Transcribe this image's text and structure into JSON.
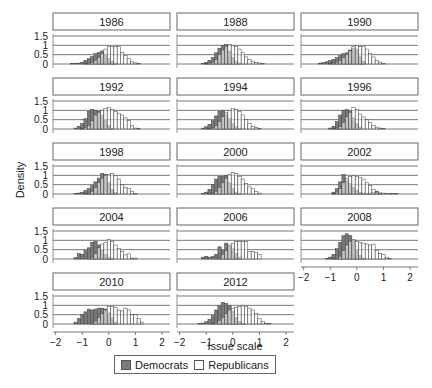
{
  "chart_data": {
    "type": "bar",
    "subtype": "faceted overlapping histograms",
    "title": "",
    "xlabel": "Issue scale",
    "ylabel": "Density",
    "xlim": [
      -2.1,
      2.3
    ],
    "ylim": [
      0,
      1.5
    ],
    "xticks": [
      -2,
      -1,
      0,
      1,
      2
    ],
    "yticks": [
      0,
      0.5,
      1,
      1.5
    ],
    "ytick_labels": [
      "0",
      "0.5",
      "1",
      "1.5"
    ],
    "grid": "horizontal",
    "legend": {
      "position": "bottom",
      "entries": [
        {
          "label": "Democrats",
          "color": "#777777"
        },
        {
          "label": "Republicans",
          "color": "#ffffff"
        }
      ]
    },
    "bin_centers": [
      -1.75,
      -1.625,
      -1.5,
      -1.375,
      -1.25,
      -1.125,
      -1.0,
      -0.875,
      -0.75,
      -0.625,
      -0.5,
      -0.375,
      -0.25,
      -0.125,
      0.0,
      0.125,
      0.25,
      0.375,
      0.5,
      0.625,
      0.75,
      0.875,
      1.0,
      1.125,
      1.25,
      1.375,
      1.5,
      1.625,
      1.75
    ],
    "panels": [
      {
        "year": "1986",
        "democrats": [
          0,
          0,
          0,
          0.02,
          0.03,
          0.05,
          0.1,
          0.2,
          0.3,
          0.4,
          0.55,
          0.62,
          0.7,
          0.5,
          0.3,
          0.15,
          0.05,
          0,
          0,
          0,
          0,
          0,
          0,
          0,
          0,
          0,
          0,
          0,
          0
        ],
        "republicans": [
          0,
          0,
          0,
          0,
          0,
          0,
          0,
          0.02,
          0.05,
          0.1,
          0.2,
          0.35,
          0.55,
          0.8,
          0.95,
          0.92,
          0.95,
          0.95,
          0.62,
          0.45,
          0.28,
          0.12,
          0.06,
          0.02,
          0,
          0,
          0,
          0,
          0
        ]
      },
      {
        "year": "1988",
        "democrats": [
          0,
          0,
          0,
          0,
          0,
          0.03,
          0.08,
          0.2,
          0.35,
          0.6,
          0.85,
          1.0,
          1.05,
          0.7,
          0.35,
          0.15,
          0.05,
          0,
          0,
          0,
          0,
          0,
          0,
          0,
          0,
          0,
          0,
          0,
          0
        ],
        "republicans": [
          0,
          0,
          0,
          0,
          0,
          0,
          0.02,
          0.05,
          0.1,
          0.25,
          0.5,
          0.75,
          0.95,
          1.05,
          1.0,
          0.95,
          0.8,
          0.6,
          0.38,
          0.25,
          0.15,
          0.08,
          0.05,
          0.02,
          0,
          0,
          0,
          0,
          0
        ]
      },
      {
        "year": "1990",
        "democrats": [
          0,
          0,
          0,
          0.05,
          0.08,
          0.12,
          0.18,
          0.25,
          0.35,
          0.45,
          0.55,
          0.6,
          0.75,
          0.85,
          0.8,
          0.4,
          0.15,
          0,
          0,
          0,
          0,
          0,
          0,
          0,
          0,
          0,
          0,
          0,
          0
        ],
        "republicans": [
          0,
          0,
          0,
          0,
          0,
          0,
          0.02,
          0.05,
          0.1,
          0.2,
          0.35,
          0.5,
          0.7,
          0.95,
          1.0,
          0.95,
          0.95,
          0.8,
          0.55,
          0.38,
          0.2,
          0.1,
          0.03,
          0,
          0,
          0,
          0,
          0,
          0
        ]
      },
      {
        "year": "1992",
        "democrats": [
          0,
          0,
          0,
          0,
          0.05,
          0.15,
          0.3,
          0.55,
          0.95,
          1.05,
          1.0,
          0.95,
          0.75,
          0.45,
          0.2,
          0.05,
          0,
          0,
          0,
          0,
          0,
          0,
          0,
          0,
          0,
          0,
          0,
          0,
          0
        ],
        "republicans": [
          0,
          0,
          0,
          0,
          0,
          0,
          0.03,
          0.08,
          0.2,
          0.45,
          0.75,
          0.9,
          1.0,
          1.1,
          1.15,
          1.05,
          0.95,
          0.85,
          0.75,
          0.6,
          0.45,
          0.2,
          0.05,
          0.02,
          0,
          0,
          0,
          0,
          0
        ]
      },
      {
        "year": "1994",
        "democrats": [
          0,
          0,
          0,
          0,
          0,
          0.05,
          0.12,
          0.25,
          0.45,
          0.7,
          0.95,
          1.0,
          0.8,
          0.55,
          0.3,
          0.12,
          0.05,
          0,
          0,
          0,
          0,
          0,
          0,
          0,
          0,
          0,
          0,
          0,
          0
        ],
        "republicans": [
          0,
          0,
          0,
          0,
          0,
          0,
          0,
          0.03,
          0.08,
          0.2,
          0.4,
          0.65,
          0.9,
          1.0,
          1.1,
          1.05,
          0.95,
          0.75,
          0.5,
          0.3,
          0.15,
          0.07,
          0.02,
          0,
          0,
          0,
          0,
          0,
          0
        ]
      },
      {
        "year": "1996",
        "democrats": [
          0,
          0,
          0,
          0,
          0,
          0,
          0.05,
          0.15,
          0.4,
          0.75,
          1.0,
          1.05,
          0.95,
          0.6,
          0.3,
          0.1,
          0,
          0,
          0,
          0,
          0,
          0,
          0,
          0,
          0,
          0,
          0,
          0,
          0
        ],
        "republicans": [
          0,
          0,
          0,
          0,
          0,
          0,
          0,
          0.02,
          0.05,
          0.15,
          0.35,
          0.65,
          0.9,
          1.15,
          1.05,
          0.8,
          0.65,
          0.5,
          0.35,
          0.2,
          0.1,
          0.05,
          0.02,
          0,
          0,
          0,
          0,
          0,
          0
        ]
      },
      {
        "year": "1998",
        "democrats": [
          0,
          0,
          0,
          0,
          0.03,
          0.05,
          0.1,
          0.2,
          0.3,
          0.45,
          0.65,
          0.85,
          1.1,
          1.05,
          0.6,
          0.25,
          0.08,
          0,
          0,
          0,
          0,
          0,
          0,
          0,
          0,
          0,
          0,
          0,
          0
        ],
        "republicans": [
          0,
          0,
          0,
          0,
          0,
          0,
          0,
          0.02,
          0.05,
          0.15,
          0.35,
          0.6,
          0.85,
          1.0,
          1.05,
          1.1,
          1.0,
          0.8,
          0.5,
          0.35,
          0.3,
          0.15,
          0.03,
          0,
          0,
          0,
          0,
          0,
          0
        ]
      },
      {
        "year": "2000",
        "democrats": [
          0,
          0,
          0,
          0,
          0,
          0.03,
          0.1,
          0.25,
          0.5,
          0.8,
          0.95,
          0.95,
          1.0,
          0.6,
          0.3,
          0.1,
          0.03,
          0,
          0,
          0,
          0,
          0,
          0,
          0,
          0,
          0,
          0,
          0,
          0
        ],
        "republicans": [
          0,
          0,
          0,
          0,
          0,
          0,
          0,
          0.02,
          0.05,
          0.15,
          0.35,
          0.6,
          0.85,
          1.05,
          1.15,
          1.1,
          0.95,
          0.8,
          0.55,
          0.38,
          0.28,
          0.15,
          0.05,
          0,
          0,
          0,
          0,
          0,
          0
        ]
      },
      {
        "year": "2002",
        "democrats": [
          0,
          0,
          0,
          0,
          0,
          0,
          0,
          0.1,
          0.3,
          0.65,
          1.05,
          0.75,
          0.55,
          0.35,
          0.2,
          0.1,
          0.05,
          0.02,
          0.05,
          0.08,
          0.15,
          0.05,
          0,
          0,
          0,
          0,
          0,
          0,
          0
        ],
        "republicans": [
          0,
          0,
          0,
          0,
          0,
          0,
          0,
          0.02,
          0.1,
          0.3,
          0.6,
          0.85,
          0.95,
          1.0,
          0.95,
          0.9,
          0.8,
          0.6,
          0.45,
          0.25,
          0.1,
          0.05,
          0.05,
          0.03,
          0.02,
          0.03,
          0.02,
          0,
          0
        ]
      },
      {
        "year": "2004",
        "democrats": [
          0,
          0,
          0,
          0,
          0.08,
          0.3,
          0.25,
          0.45,
          0.6,
          0.9,
          0.95,
          0.75,
          0.45,
          0.25,
          0.1,
          0.03,
          0,
          0,
          0,
          0,
          0,
          0,
          0,
          0,
          0,
          0,
          0,
          0,
          0
        ],
        "republicans": [
          0,
          0,
          0,
          0,
          0,
          0,
          0,
          0,
          0,
          0.1,
          0.3,
          0.6,
          0.8,
          0.9,
          1.05,
          0.95,
          0.75,
          0.55,
          0.4,
          0.22,
          0.28,
          0.05,
          0.05,
          0,
          0,
          0,
          0,
          0,
          0
        ]
      },
      {
        "year": "2006",
        "democrats": [
          0,
          0,
          0,
          0,
          0,
          0.1,
          0.15,
          0.1,
          0.15,
          0.25,
          0.65,
          0.45,
          0.85,
          0.7,
          0.55,
          0.3,
          0.1,
          0,
          0,
          0,
          0,
          0,
          0,
          0,
          0,
          0,
          0,
          0,
          0
        ],
        "republicans": [
          0,
          0,
          0,
          0,
          0,
          0,
          0,
          0,
          0,
          0,
          0.05,
          0.25,
          0.45,
          0.75,
          0.85,
          0.95,
          0.95,
          0.95,
          0.95,
          0.4,
          0.4,
          0.35,
          0.25,
          0,
          0,
          0,
          0,
          0,
          0
        ]
      },
      {
        "year": "2008",
        "democrats": [
          0,
          0,
          0,
          0,
          0,
          0.02,
          0.1,
          0.25,
          0.55,
          0.9,
          1.25,
          1.35,
          1.25,
          1.0,
          0.5,
          0.2,
          0.05,
          0,
          0,
          0,
          0,
          0,
          0,
          0,
          0,
          0,
          0,
          0,
          0
        ],
        "republicans": [
          0,
          0,
          0,
          0,
          0,
          0,
          0,
          0.02,
          0.05,
          0.15,
          0.45,
          0.75,
          0.95,
          1.05,
          0.95,
          0.9,
          0.85,
          0.8,
          0.75,
          0.8,
          0.45,
          0.3,
          0.25,
          0.08,
          0.03,
          0,
          0,
          0,
          0
        ]
      },
      {
        "year": "2010",
        "democrats": [
          0,
          0,
          0,
          0,
          0.1,
          0.3,
          0.5,
          0.65,
          0.8,
          0.75,
          0.8,
          0.85,
          0.85,
          0.8,
          0.6,
          0.35,
          0.1,
          0,
          0,
          0,
          0,
          0,
          0,
          0,
          0,
          0,
          0,
          0,
          0
        ],
        "republicans": [
          0,
          0,
          0,
          0,
          0,
          0,
          0,
          0,
          0,
          0.05,
          0.15,
          0.35,
          0.55,
          0.75,
          0.95,
          0.95,
          0.9,
          0.75,
          0.7,
          0.85,
          0.75,
          0.5,
          0.5,
          0.3,
          0.1,
          0,
          0,
          0,
          0
        ]
      },
      {
        "year": "2012",
        "democrats": [
          0,
          0,
          0,
          0,
          0.02,
          0.05,
          0.12,
          0.25,
          0.45,
          0.75,
          1.0,
          1.15,
          1.1,
          1.0,
          0.7,
          0.35,
          0.15,
          0.05,
          0,
          0,
          0,
          0,
          0,
          0,
          0,
          0,
          0,
          0,
          0
        ],
        "republicans": [
          0,
          0,
          0,
          0,
          0,
          0,
          0,
          0,
          0.02,
          0.08,
          0.2,
          0.35,
          0.55,
          0.75,
          0.85,
          0.9,
          0.95,
          1.0,
          0.95,
          0.85,
          0.75,
          0.55,
          0.3,
          0.15,
          0.05,
          0.02,
          0,
          0,
          0
        ]
      }
    ]
  },
  "colors": {
    "democrats": "#7a7a7a",
    "republicans": "#ffffff",
    "bar_edge": "#444444",
    "grid": "#555555",
    "header_border": "#666666"
  },
  "legend": {
    "democrats_label": "Democrats",
    "republicans_label": "Republicans"
  },
  "axes": {
    "xlabel": "Issue scale",
    "ylabel": "Density"
  }
}
